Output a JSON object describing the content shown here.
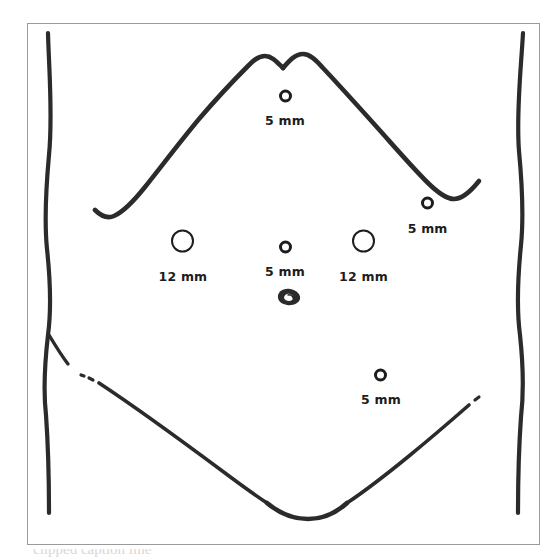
{
  "figure": {
    "kind": "line-drawing",
    "frame_color": "#9a9a9a",
    "ink_color": "#2b2b2b",
    "background_color": "#ffffff"
  },
  "caption": {
    "text": "clipped caption line"
  },
  "umbilicus": {
    "name": "umbilicus"
  },
  "ports": [
    {
      "id": "epigastric",
      "label": "5 mm",
      "size": "5",
      "x_pct": 50.3,
      "y_pct": 14.0
    },
    {
      "id": "right-flank",
      "label": "5 mm",
      "size": "5",
      "x_pct": 78.1,
      "y_pct": 34.6
    },
    {
      "id": "left-midclavicular",
      "label": "12 mm",
      "size": "12",
      "x_pct": 30.4,
      "y_pct": 41.9
    },
    {
      "id": "supraumbilical-midline",
      "label": "5 mm",
      "size": "5",
      "x_pct": 50.3,
      "y_pct": 43.0
    },
    {
      "id": "right-midclavicular",
      "label": "12 mm",
      "size": "12",
      "x_pct": 65.6,
      "y_pct": 41.9
    },
    {
      "id": "right-lower-quadrant",
      "label": "5 mm",
      "size": "5",
      "x_pct": 69.0,
      "y_pct": 67.5
    }
  ]
}
